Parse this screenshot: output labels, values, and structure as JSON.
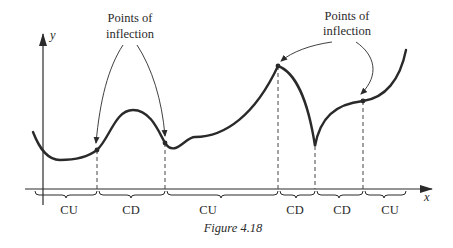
{
  "figure": {
    "caption": "Figure 4.18",
    "axis_x_label": "x",
    "axis_y_label": "y",
    "annotations": [
      {
        "id": "left",
        "line1": "Points of",
        "line2": "inflection"
      },
      {
        "id": "right",
        "line1": "Points of",
        "line2": "inflection"
      }
    ],
    "intervals": [
      {
        "label": "CU",
        "concavity": "concave up"
      },
      {
        "label": "CD",
        "concavity": "concave down"
      },
      {
        "label": "CU",
        "concavity": "concave up"
      },
      {
        "label": "CD",
        "concavity": "concave down"
      },
      {
        "label": "CD",
        "concavity": "concave down"
      },
      {
        "label": "CU",
        "concavity": "concave up"
      }
    ],
    "colors": {
      "ink": "#2a2a2a",
      "background": "#ffffff"
    }
  }
}
